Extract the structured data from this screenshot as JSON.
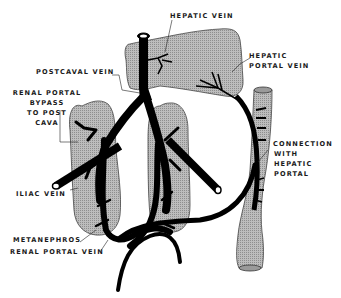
{
  "diagram": {
    "colors": {
      "organ_fill": "#b4b4b4",
      "organ_stroke": "#555555",
      "vein": "#000000",
      "background": "#ffffff",
      "label": "#1a1a1a"
    },
    "labels": {
      "hepatic_vein": "HEPATIC VEIN",
      "hepatic_portal_vein_1": "HEPATIC",
      "hepatic_portal_vein_2": "PORTAL VEIN",
      "postcaval_vein": "POSTCAVAL VEIN",
      "renal_portal_bypass_1": "RENAL PORTAL",
      "renal_portal_bypass_2": "BYPASS",
      "renal_portal_bypass_3": "TO POST",
      "renal_portal_bypass_4": "CAVA",
      "connection_1": "CONNECTION",
      "connection_2": "WITH",
      "connection_3": "HEPATIC",
      "connection_4": "PORTAL",
      "iliac_vein": "ILIAC VEIN",
      "metanephros": "METANEPHROS",
      "renal_portal_vein": "RENAL PORTAL VEIN"
    },
    "structures": [
      "liver",
      "left-metanephros",
      "right-metanephros",
      "intestine",
      "postcaval-vein",
      "iliac-veins",
      "renal-portal-veins",
      "hepatic-portal-vein"
    ]
  }
}
